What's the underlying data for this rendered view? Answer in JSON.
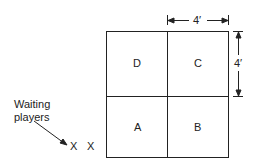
{
  "diagram": {
    "squares": [
      {
        "id": "D",
        "label": "D"
      },
      {
        "id": "C",
        "label": "C"
      },
      {
        "id": "A",
        "label": "A"
      },
      {
        "id": "B",
        "label": "B"
      }
    ],
    "dimensions": {
      "width_label": "4′",
      "height_label": "4′"
    },
    "waiting": {
      "label_line1": "Waiting",
      "label_line2": "players",
      "markers": [
        "X",
        "X"
      ]
    },
    "colors": {
      "line": "#222222",
      "background": "#ffffff"
    }
  }
}
